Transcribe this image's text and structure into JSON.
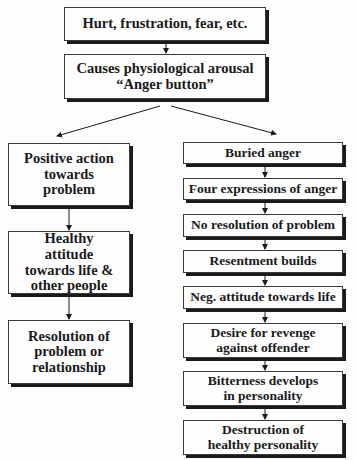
{
  "diagram": {
    "top": [
      {
        "id": "n1",
        "label": "Hurt, frustration, fear, etc."
      },
      {
        "id": "n2",
        "label": "Causes physiological arousal “Anger button”"
      }
    ],
    "left_branch": [
      {
        "id": "l1",
        "label": "Positive action towards problem"
      },
      {
        "id": "l2",
        "label": "Healthy attitude towards life & other people"
      },
      {
        "id": "l3",
        "label": "Resolution of problem or relationship"
      }
    ],
    "right_branch": [
      {
        "id": "r1",
        "label": "Buried anger"
      },
      {
        "id": "r2",
        "label": "Four expressions of anger"
      },
      {
        "id": "r3",
        "label": "No resolution of problem"
      },
      {
        "id": "r4",
        "label": "Resentment builds"
      },
      {
        "id": "r5",
        "label": "Neg. attitude towards life"
      },
      {
        "id": "r6",
        "label": "Desire for revenge against offender"
      },
      {
        "id": "r7",
        "label": "Bitterness develops in personality"
      },
      {
        "id": "r8",
        "label": "Destruction of healthy personality"
      }
    ],
    "edges": [
      [
        "n1",
        "n2"
      ],
      [
        "n2",
        "l1"
      ],
      [
        "n2",
        "r1"
      ],
      [
        "l1",
        "l2"
      ],
      [
        "l2",
        "l3"
      ],
      [
        "r1",
        "r2"
      ],
      [
        "r2",
        "r3"
      ],
      [
        "r3",
        "r4"
      ],
      [
        "r4",
        "r5"
      ],
      [
        "r5",
        "r6"
      ],
      [
        "r6",
        "r7"
      ],
      [
        "r7",
        "r8"
      ]
    ]
  }
}
